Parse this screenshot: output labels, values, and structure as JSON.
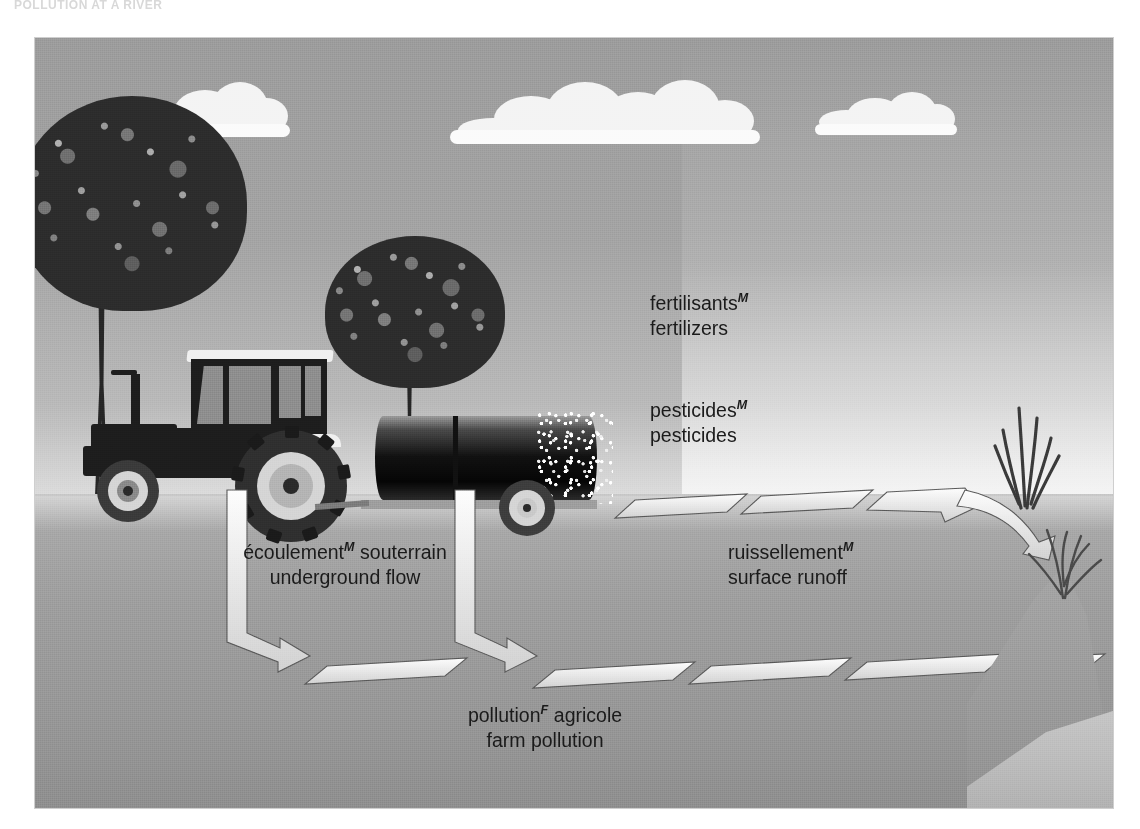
{
  "page": {
    "title": "POLLUTION AT A RIVER"
  },
  "figure": {
    "caption_labels": [
      {
        "name": "fertilizers",
        "french": "fertilisants",
        "gender_mark": "M",
        "english": "fertilizers"
      },
      {
        "name": "pesticides",
        "french": "pesticides",
        "gender_mark": "M",
        "english": "pesticides"
      },
      {
        "name": "underground-flow",
        "french_before": "écoulement",
        "gender_mark": "M",
        "french_after": " souterrain",
        "english": "underground flow"
      },
      {
        "name": "surface-runoff",
        "french": "ruissellement",
        "gender_mark": "M",
        "english": "surface runoff"
      },
      {
        "name": "farm-pollution",
        "french_before": "pollution",
        "gender_mark": "F",
        "french_after": " agricole",
        "english": "farm pollution"
      }
    ],
    "colors": {
      "sky": "#a0a0a0",
      "ground": "#a3a3a3",
      "cloud": "#f7f7f7",
      "foliage": "#2c2c2c",
      "tractor_body": "#1d1d1d",
      "tank": "#0b0b0b",
      "arrow_fill": "#efefef",
      "arrow_stroke": "#4a4a4a",
      "text": "#1a1a1a",
      "water": "#b9b9b9"
    },
    "scene_elements": [
      "sky",
      "clouds",
      "trees",
      "tractor",
      "tank-trailer",
      "spray-particles",
      "ground",
      "subsoil",
      "underground-flow-arrows",
      "surface-runoff-arrows",
      "riverbank-reeds",
      "river"
    ]
  }
}
